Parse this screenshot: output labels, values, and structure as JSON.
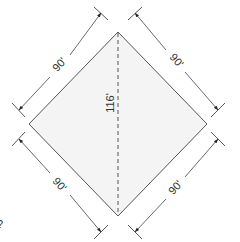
{
  "diagram": {
    "shape": "square rotated 45 degrees",
    "fill_color": "#f4f4f4",
    "stroke_color": "#555555",
    "sides": [
      {
        "id": "top-left",
        "label": "90'"
      },
      {
        "id": "top-right",
        "label": "90'"
      },
      {
        "id": "bottom-left",
        "label": "90'"
      },
      {
        "id": "bottom-right",
        "label": "90'"
      }
    ],
    "diagonal": {
      "orientation": "vertical",
      "style": "dashed",
      "label": "116'"
    },
    "stray_mark": "?"
  }
}
